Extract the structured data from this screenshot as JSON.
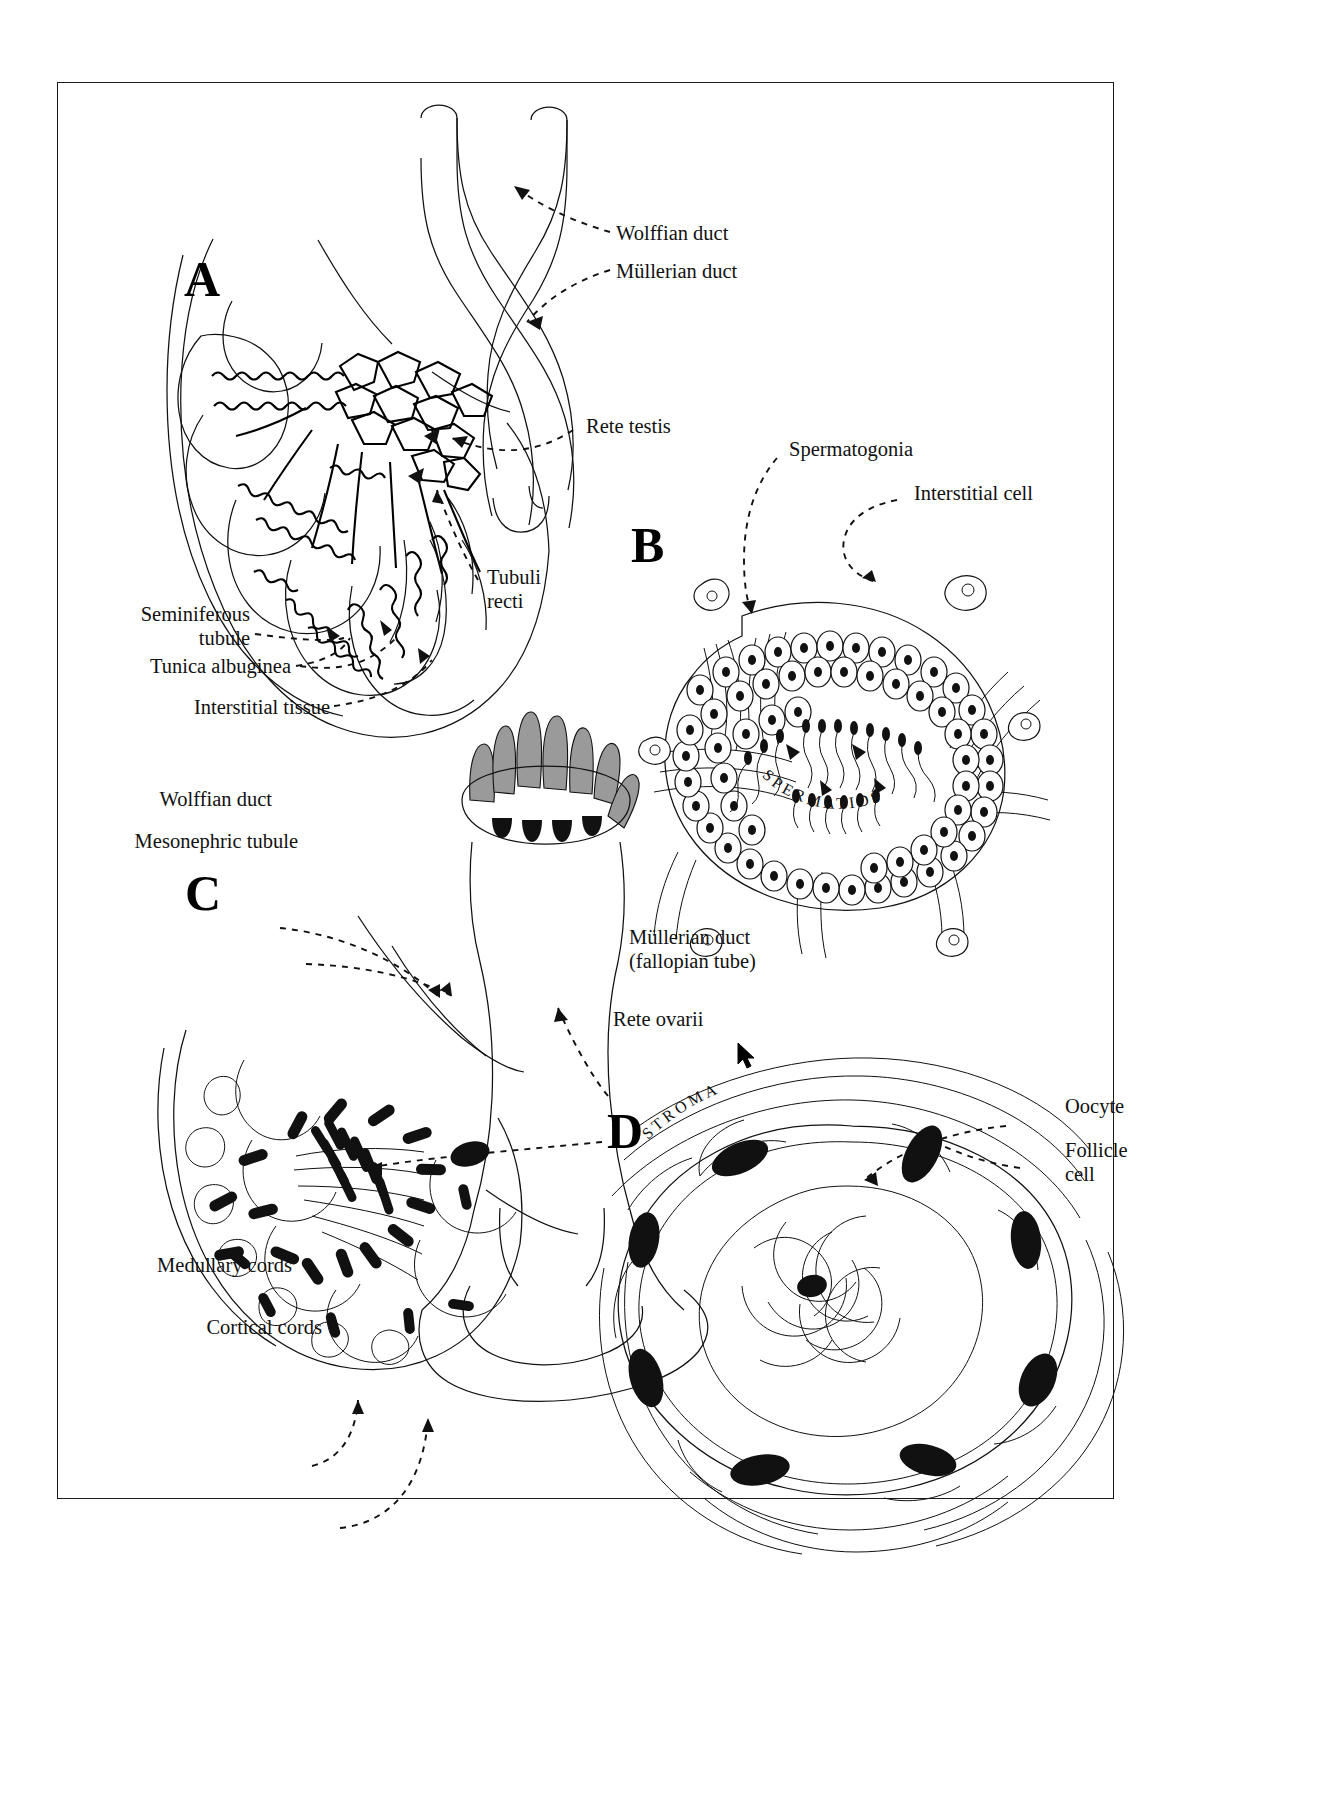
{
  "figure": {
    "panels": [
      {
        "id": "A",
        "letter": "A",
        "caption": "Testis — seminiferous tubules, rete testis and genital ducts"
      },
      {
        "id": "B",
        "letter": "B",
        "caption": "Seminiferous tubule cross-section"
      },
      {
        "id": "C",
        "letter": "C",
        "caption": "Ovary — medullary and cortical cords, rete ovarii"
      },
      {
        "id": "D",
        "letter": "D",
        "caption": "Primordial follicle"
      }
    ]
  },
  "labels": {
    "panel_a": [
      {
        "name": "wolffian-duct",
        "text": "Wolffian duct",
        "align": "left"
      },
      {
        "name": "mullerian-duct",
        "text": "Müllerian duct",
        "align": "left"
      },
      {
        "name": "rete-testis",
        "text": "Rete testis",
        "align": "left"
      },
      {
        "name": "tubuli-recti",
        "text": "Tubuli\nrecti",
        "align": "left"
      },
      {
        "name": "seminiferous-tubule",
        "text": "Seminiferous\ntubule",
        "align": "right"
      },
      {
        "name": "tunica-albuginea",
        "text": "Tunica albuginea",
        "align": "right"
      },
      {
        "name": "interstitial-tissue",
        "text": "Interstitial tissue",
        "align": "right"
      }
    ],
    "panel_b": [
      {
        "name": "spermatogonia",
        "text": "Spermatogonia",
        "align": "left"
      },
      {
        "name": "interstitial-cell",
        "text": "Interstitial cell",
        "align": "left"
      },
      {
        "name": "spermatids",
        "text": "SPERMATIDS",
        "align": "curved"
      }
    ],
    "panel_c": [
      {
        "name": "wolffian-duct",
        "text": "Wolffian duct",
        "align": "right"
      },
      {
        "name": "mesonephric-tubule",
        "text": "Mesonephric tubule",
        "align": "right"
      },
      {
        "name": "mullerian-duct-fallopian",
        "text": "Müllerian duct\n(fallopian tube)",
        "align": "left"
      },
      {
        "name": "rete-ovarii",
        "text": "Rete ovarii",
        "align": "left"
      },
      {
        "name": "medullary-cords",
        "text": "Medullary cords",
        "align": "right"
      },
      {
        "name": "cortical-cords",
        "text": "Cortical cords",
        "align": "right"
      }
    ],
    "panel_d": [
      {
        "name": "oocyte",
        "text": "Oocyte",
        "align": "left"
      },
      {
        "name": "follicle-cell",
        "text": "Follicle\ncell",
        "align": "left"
      },
      {
        "name": "stroma",
        "text": "STROMA",
        "align": "curved"
      }
    ]
  },
  "colors": {
    "ink": "#111111",
    "paper": "#ffffff",
    "cilia_gray": "#9a9a9a",
    "frame": "#1a1a1a"
  },
  "cursor": {
    "name": "mouse-pointer",
    "x": 737,
    "y": 1042
  }
}
